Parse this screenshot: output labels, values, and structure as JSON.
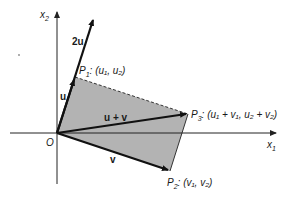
{
  "diagram": {
    "colors": {
      "fill": "#b3b3b3",
      "stroke": "#111111",
      "axis": "#222222",
      "background": "#ffffff"
    },
    "axes": {
      "x_label": "x",
      "x_sub": "1",
      "y_label": "x",
      "y_sub": "2",
      "origin_label": "O"
    },
    "vectors": {
      "u": {
        "label": "u"
      },
      "two_u": {
        "label": "2u"
      },
      "v": {
        "label": "v"
      },
      "u_plus_v": {
        "label": "u + v"
      }
    },
    "points": {
      "p1": {
        "name": "P",
        "sub": "1",
        "coords": ": (u₁, u₂)"
      },
      "p2": {
        "name": "P",
        "sub": "2",
        "coords": ": (v₁, v₂)"
      },
      "p3": {
        "name": "P",
        "sub": "3",
        "coords": ": (u₁ + v₁, u₂ + v₂)"
      }
    }
  }
}
